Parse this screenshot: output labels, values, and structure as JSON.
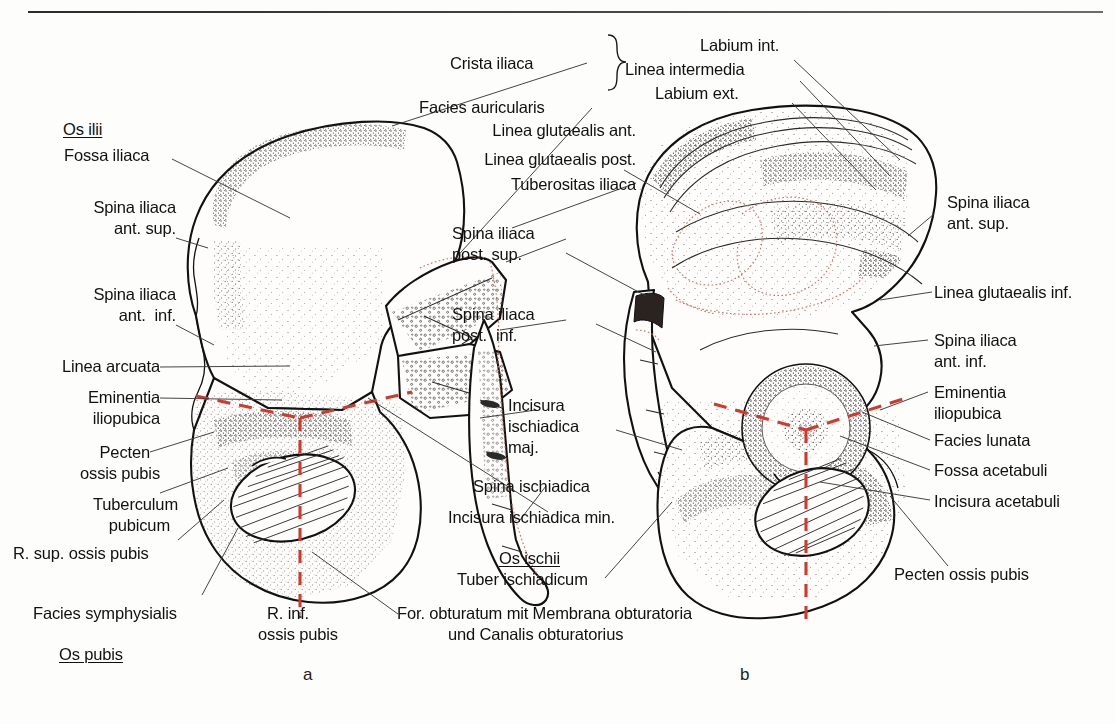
{
  "figure": {
    "panel_a_id": "a",
    "panel_b_id": "b",
    "accent_cartilage_color": "#d2392b",
    "accent_outline_color": "#c8705c"
  },
  "labels_left": {
    "os_ilii": "Os ilii",
    "fossa_iliaca": "Fossa iliaca",
    "spina_iliaca_ant_sup_l1": "Spina iliaca",
    "spina_iliaca_ant_sup_l2": "ant. sup.",
    "spina_iliaca_ant_inf_l1": "Spina iliaca",
    "spina_iliaca_ant_inf_l2": "ant.  inf.",
    "linea_arcuata": "Linea arcuata",
    "eminentia_l1": "Eminentia",
    "eminentia_l2": "iliopubica",
    "pecten_l1": "Pecten",
    "pecten_l2": "ossis pubis",
    "tuberculum_l1": "Tuberculum",
    "tuberculum_l2": "pubicum",
    "r_sup_ossis_pubis": "R. sup. ossis pubis",
    "facies_symphysialis": "Facies symphysialis",
    "os_pubis": "Os pubis"
  },
  "labels_center": {
    "crista_iliaca": "Crista iliaca",
    "facies_auricularis": "Facies auricularis",
    "linea_glutaealis_ant": "Linea glutaealis ant.",
    "linea_glutaealis_post": "Linea glutaealis post.",
    "tuberositas_iliaca": "Tuberositas iliaca",
    "spina_iliaca_post_sup_l1": "Spina iliaca",
    "spina_iliaca_post_sup_l2": "post. sup.",
    "spina_iliaca_post_inf_l1": "Spina iliaca",
    "spina_iliaca_post_inf_l2": "post.  inf.",
    "incisura_isch_maj_l1": "Incisura",
    "incisura_isch_maj_l2": "ischiadica",
    "incisura_isch_maj_l3": "maj.",
    "spina_ischiadica": "Spina ischiadica",
    "incisura_isch_min": "Incisura ischiadica min.",
    "os_ischii": "Os ischii",
    "tuber_ischiadicum": "Tuber ischiadicum",
    "r_inf_l1": "R. inf.",
    "r_inf_l2": "ossis pubis",
    "foramen_l1": "For. obturatum mit Membrana obturatoria",
    "foramen_l2": "und Canalis obturatorius"
  },
  "labels_top": {
    "labium_int": "Labium int.",
    "linea_intermedia": "Linea intermedia",
    "labium_ext": "Labium ext."
  },
  "labels_right": {
    "spina_iliaca_ant_sup_l1": "Spina iliaca",
    "spina_iliaca_ant_sup_l2": "ant. sup.",
    "linea_glutaealis_inf": "Linea glutaealis inf.",
    "spina_iliaca_ant_inf_l1": "Spina iliaca",
    "spina_iliaca_ant_inf_l2": "ant. inf.",
    "eminentia_l1": "Eminentia",
    "eminentia_l2": "iliopubica",
    "facies_lunata": "Facies lunata",
    "fossa_acetabuli": "Fossa acetabuli",
    "incisura_acetabuli": "Incisura acetabuli",
    "pecten_ossis_pubis": "Pecten ossis pubis"
  }
}
